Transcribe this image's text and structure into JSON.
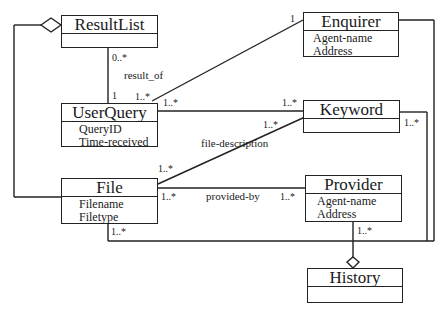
{
  "diagram": {
    "type": "UML class diagram",
    "classes": {
      "resultlist": {
        "name": "ResultList",
        "attributes": []
      },
      "enquirer": {
        "name": "Enquirer",
        "attributes": [
          "Agent-name",
          "Address"
        ]
      },
      "userquery": {
        "name": "UserQuery",
        "attributes": [
          "QueryID",
          "Time-received"
        ]
      },
      "keyword": {
        "name": "Keyword",
        "attributes": []
      },
      "file": {
        "name": "File",
        "attributes": [
          "Filename",
          "Filetype"
        ]
      },
      "provider": {
        "name": "Provider",
        "attributes": [
          "Agent-name",
          "Address"
        ]
      },
      "history": {
        "name": "History",
        "attributes": []
      }
    },
    "associations": {
      "result_of": {
        "label": "result_of",
        "from": "ResultList",
        "to": "UserQuery",
        "from_mult": "0..*",
        "to_mult": "1"
      },
      "enquirer_userquery": {
        "from": "Enquirer",
        "to": "UserQuery",
        "from_mult": "1",
        "to_mult": "1..*"
      },
      "userquery_keyword": {
        "from": "UserQuery",
        "to": "Keyword",
        "from_mult": "1..*",
        "to_mult": "1..*"
      },
      "file_description": {
        "label": "file-description",
        "from": "File",
        "to": "Keyword",
        "from_mult": "1..*",
        "to_mult": "1..*"
      },
      "provided_by": {
        "label": "provided-by",
        "from": "File",
        "to": "Provider",
        "from_mult": "1..*",
        "to_mult": "1..*"
      },
      "keyword_history": {
        "from": "Keyword",
        "to": "History",
        "from_mult": "1..*"
      },
      "file_history": {
        "from": "File",
        "to": "History",
        "from_mult": "1..*"
      },
      "provider_history": {
        "from": "Provider",
        "to": "History",
        "from_mult": "1..*"
      }
    },
    "multiplicities": {
      "resultlist_0n": "0..*",
      "userquery_1": "1",
      "userquery_enq_1n": "1..*",
      "userquery_kw_1n": "1..*",
      "enquirer_1": "1",
      "keyword_uq_1n": "1..*",
      "keyword_file_1n": "1..*",
      "keyword_right_1n": "1..*",
      "file_kw_1n": "1..*",
      "file_prov_1n": "1..*",
      "file_bottom_1n": "1..*",
      "provider_file_1n": "1..*",
      "provider_bottom_1n": "1..*"
    },
    "line_color": "#222222"
  }
}
